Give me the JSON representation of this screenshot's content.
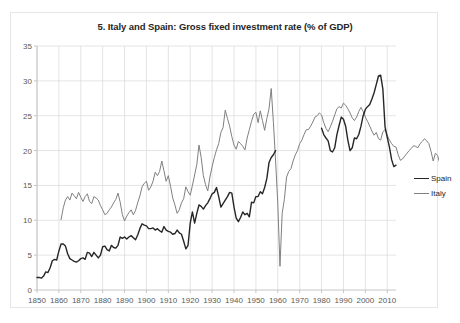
{
  "chart_data": {
    "type": "line",
    "title": "5. Italy and Spain: Gross fixed investment rate (% of GDP)",
    "xlabel": "",
    "ylabel": "",
    "xlim": [
      1850,
      2014
    ],
    "ylim": [
      0,
      35
    ],
    "xticks": [
      1850,
      1860,
      1870,
      1880,
      1890,
      1900,
      1910,
      1920,
      1930,
      1940,
      1950,
      1960,
      1970,
      1980,
      1990,
      2000,
      2010
    ],
    "yticks": [
      0,
      5,
      10,
      15,
      20,
      25,
      30,
      35
    ],
    "grid": true,
    "legend_position": "right",
    "series": [
      {
        "name": "Spain",
        "color": "#262626",
        "x_start": 1850,
        "segments": [
          {
            "x_start": 1850,
            "values": [
              1.8,
              1.8,
              1.7,
              2.0,
              2.6,
              2.5,
              3.2,
              4.2,
              4.4,
              4.3,
              5.6,
              6.6,
              6.6,
              6.3,
              5.2,
              4.5,
              4.3,
              4.1,
              4.0,
              4.2,
              4.5,
              4.6,
              4.4,
              5.4,
              5.3,
              4.8,
              5.4,
              5.0,
              4.6,
              5.0,
              6.2,
              6.3,
              5.8,
              5.6,
              6.4,
              6.1,
              6.0,
              6.4,
              7.6,
              7.4,
              7.6,
              7.3,
              7.6,
              7.8,
              7.5,
              7.2,
              7.9,
              8.8,
              9.5,
              9.3,
              9.2,
              8.8,
              8.8,
              8.9,
              8.6,
              8.8,
              8.5,
              8.3,
              9.1,
              8.6,
              8.4,
              8.3,
              8.0,
              8.1,
              8.6,
              8.2,
              8.0,
              7.0,
              5.9,
              6.4,
              9.6,
              11.2,
              9.6,
              11.0,
              12.2,
              12.0,
              11.6,
              12.1,
              12.5,
              13.1,
              13.8,
              14.0,
              14.7,
              13.4,
              11.9,
              12.4,
              12.9,
              13.4,
              14.0,
              13.9,
              11.9,
              10.3,
              9.8,
              10.4,
              11.2,
              10.8,
              11.0,
              10.5,
              12.6,
              12.5,
              13.4,
              13.4,
              14.1,
              13.8,
              14.7,
              16.0,
              18.3,
              19.0,
              19.4,
              20.0
            ]
          },
          {
            "x_start": 1980,
            "values": [
              23.2,
              22.3,
              21.8,
              21.4,
              20.0,
              19.8,
              20.4,
              22.3,
              23.6,
              24.8,
              24.5,
              23.5,
              21.5,
              20.0,
              20.4,
              21.8,
              21.7,
              22.3,
              23.5,
              25.0,
              25.9,
              26.3,
              26.6,
              27.4,
              28.3,
              29.5,
              30.7,
              30.8,
              28.8,
              23.4,
              21.9,
              20.5,
              18.7,
              17.7,
              17.9
            ]
          }
        ]
      },
      {
        "name": "Italy",
        "color": "#808080",
        "x_start": 1861,
        "segments": [
          {
            "x_start": 1861,
            "values": [
              10.1,
              11.8,
              12.9,
              13.4,
              12.9,
              13.9,
              13.5,
              13.1,
              14.0,
              13.3,
              12.7,
              13.4,
              13.8,
              12.7,
              12.4,
              13.4,
              13.2,
              12.9,
              12.1,
              11.5,
              10.8,
              11.0,
              11.5,
              11.9,
              12.5,
              13.0,
              13.9,
              12.6,
              10.8,
              9.9,
              10.6,
              11.1,
              11.5,
              10.8,
              11.4,
              12.5,
              13.5,
              14.8,
              15.3,
              15.6,
              14.3,
              14.8,
              15.6,
              16.9,
              16.4,
              17.0,
              18.5,
              17.1,
              15.6,
              16.4,
              14.9,
              13.2,
              12.2,
              11.0,
              11.5,
              12.5,
              13.1,
              14.8,
              14.1,
              13.6,
              15.0,
              16.5,
              18.0,
              20.8,
              19.0,
              16.4,
              15.1,
              14.2,
              16.2,
              17.7,
              19.0,
              20.1,
              21.0,
              22.6,
              23.3,
              25.8,
              24.6,
              23.5,
              22.0,
              20.8,
              20.2,
              21.3,
              21.0,
              20.6,
              20.1,
              21.8,
              23.0,
              24.2,
              25.2,
              25.5,
              24.0,
              25.7,
              24.3,
              22.9,
              24.6,
              26.0,
              28.9,
              24.0,
              18.5,
              12.4,
              3.4,
              11.0,
              13.0,
              16.2,
              17.0,
              17.4,
              18.5,
              19.4,
              20.0,
              21.0,
              21.5,
              22.3,
              23.0,
              23.0,
              23.5,
              24.1,
              24.8,
              25.0,
              25.4,
              25.1,
              24.0,
              23.2,
              22.7,
              23.4,
              24.2,
              25.1,
              26.0,
              26.3,
              26.1,
              26.8,
              26.5,
              26.0,
              25.4,
              24.7,
              24.3,
              24.8,
              25.6,
              26.2,
              25.6,
              24.8,
              24.2,
              23.5,
              22.8,
              22.2,
              22.6,
              21.7,
              21.5,
              22.7,
              23.0,
              22.2,
              21.5,
              21.0,
              20.6,
              20.5,
              19.4,
              18.6,
              18.8,
              19.2,
              19.6,
              20.0,
              20.3,
              20.7,
              20.6,
              20.4,
              21.0,
              21.3,
              21.7,
              21.4,
              21.0,
              19.9,
              18.5,
              19.6,
              19.3,
              18.2,
              17.5,
              17.3
            ]
          }
        ]
      }
    ]
  },
  "legend": {
    "items": [
      {
        "label": "Spain",
        "color": "#262626"
      },
      {
        "label": "Italy",
        "color": "#808080"
      }
    ]
  }
}
